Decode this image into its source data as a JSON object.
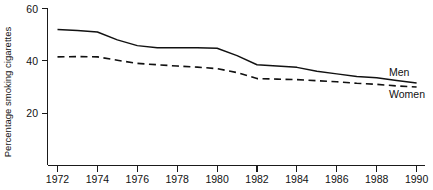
{
  "chart_data": {
    "type": "line",
    "title": "",
    "xlabel": "",
    "ylabel": "Percentage smoking cigarettes",
    "xlim": [
      1972,
      1990
    ],
    "ylim": [
      0,
      60
    ],
    "grid": false,
    "legend_position": "inline-right",
    "x": [
      1972,
      1973,
      1974,
      1975,
      1976,
      1977,
      1978,
      1979,
      1980,
      1981,
      1982,
      1983,
      1984,
      1985,
      1986,
      1987,
      1988,
      1989,
      1990
    ],
    "x_ticks": [
      1972,
      1974,
      1976,
      1978,
      1980,
      1982,
      1984,
      1986,
      1988,
      1990
    ],
    "x_tick_labels": [
      "1972",
      "1974",
      "1976",
      "1978",
      "1980",
      "1982",
      "1984",
      "1986",
      "1988",
      "1990"
    ],
    "y_ticks": [
      20,
      40,
      60
    ],
    "y_tick_labels": [
      "20",
      "40",
      "60"
    ],
    "series": [
      {
        "name": "Men",
        "style": "solid",
        "color": "#111111",
        "label": "Men",
        "values": [
          52.0,
          51.6,
          51.0,
          48.0,
          45.8,
          45.0,
          45.0,
          45.0,
          44.8,
          42.0,
          38.5,
          38.0,
          37.5,
          36.0,
          35.0,
          34.0,
          33.5,
          32.5,
          31.5
        ]
      },
      {
        "name": "Women",
        "style": "dashed",
        "color": "#111111",
        "label": "Women",
        "values": [
          41.5,
          41.6,
          41.5,
          40.2,
          39.0,
          38.5,
          38.0,
          37.6,
          37.0,
          35.5,
          33.2,
          33.0,
          32.8,
          32.4,
          32.0,
          31.4,
          31.0,
          30.4,
          30.0
        ]
      }
    ]
  },
  "labels": {
    "y_axis_title": "Percentage smoking cigarettes",
    "men": "Men",
    "women": "Women",
    "y_20": "20",
    "y_40": "40",
    "y_60": "60",
    "x_1972": "1972",
    "x_1974": "1974",
    "x_1976": "1976",
    "x_1978": "1978",
    "x_1980": "1980",
    "x_1982": "1982",
    "x_1984": "1984",
    "x_1986": "1986",
    "x_1988": "1988",
    "x_1990": "1990"
  }
}
